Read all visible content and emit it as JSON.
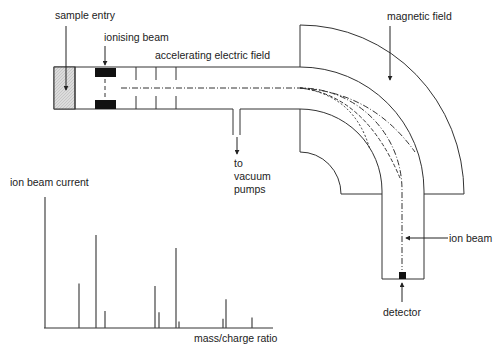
{
  "labels": {
    "sample_entry": "sample entry",
    "ionising_beam": "ionising beam",
    "accelerating_field": "accelerating electric field",
    "magnetic_field": "magnetic field",
    "vacuum_line1": "to",
    "vacuum_line2": "vacuum",
    "vacuum_line3": "pumps",
    "ion_beam": "ion beam",
    "detector": "detector"
  },
  "colors": {
    "line": "#333333",
    "sample": "#d9d9d9",
    "block": "#111111"
  },
  "chart_data": {
    "type": "bar",
    "title": "",
    "ylabel": "ion beam current",
    "xlabel": "mass/charge ratio",
    "x_pixels": [
      45,
      79,
      96,
      105,
      155,
      159,
      176,
      179,
      223,
      226,
      252
    ],
    "values": [
      100,
      34,
      71,
      13,
      32,
      12,
      61,
      5,
      7,
      22,
      8
    ],
    "ylim": [
      0,
      100
    ],
    "grid": false
  }
}
